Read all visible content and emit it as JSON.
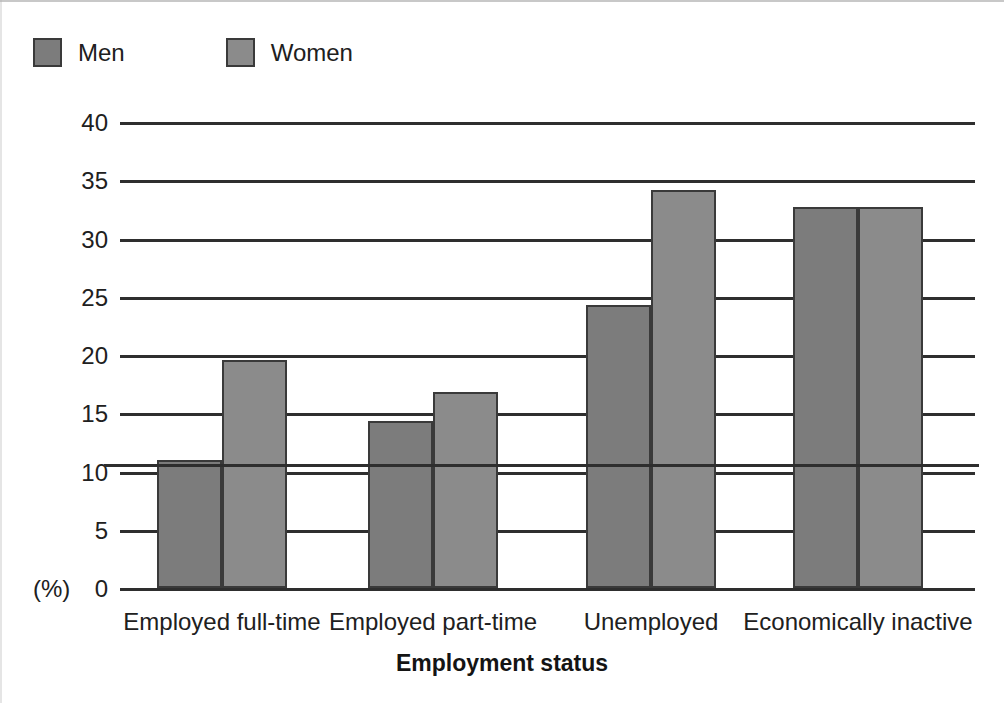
{
  "chart_data": {
    "type": "bar",
    "title": "",
    "xlabel": "Employment status",
    "ylabel": "(%)",
    "categories": [
      "Employed full-time",
      "Employed part-time",
      "Unemployed",
      "Economically inactive"
    ],
    "series": [
      {
        "name": "Men",
        "color": "#7c7c7c",
        "values": [
          11.0,
          14.3,
          24.3,
          32.7
        ]
      },
      {
        "name": "Women",
        "color": "#8b8b8b",
        "values": [
          19.6,
          16.8,
          34.2,
          32.7
        ]
      }
    ],
    "ylim": [
      0,
      40
    ],
    "ytick_step": 5,
    "yticks": [
      "40",
      "35",
      "30",
      "25",
      "20",
      "15",
      "10",
      "5",
      "0"
    ],
    "grid": "horizontal",
    "legend_position": "top-left"
  },
  "legend": {
    "entries": [
      {
        "label": "Men"
      },
      {
        "label": "Women"
      }
    ]
  },
  "axes": {
    "y_unit_label": "(%)",
    "x_title": "Employment status"
  },
  "colors": {
    "men_bar": "#7c7c7c",
    "women_bar": "#8b8b8b",
    "bar_outline": "#3a3a3a",
    "gridline": "#2e2e2e",
    "text": "#202020",
    "background": "#ffffff"
  }
}
